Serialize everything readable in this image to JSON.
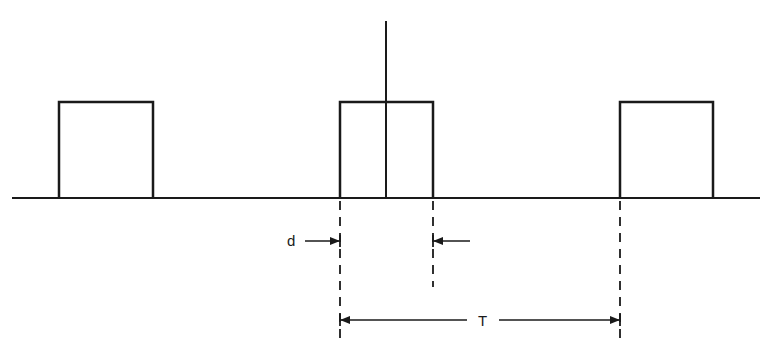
{
  "diagram": {
    "colors": {
      "stroke": "#1a1a1a",
      "background": "#ffffff"
    },
    "baseline": {
      "x1": 12,
      "x2": 760,
      "y": 198
    },
    "vertical_axis": {
      "x": 386,
      "y1": 21,
      "y2": 198
    },
    "pulses": [
      {
        "id": "left",
        "x1": 59,
        "x2": 153,
        "top": 102
      },
      {
        "id": "center",
        "x1": 340,
        "x2": 433,
        "top": 102
      },
      {
        "id": "right",
        "x1": 620,
        "x2": 713,
        "top": 102
      }
    ],
    "labels": {
      "pulse_width": "d",
      "period": "T"
    },
    "dimensions": {
      "pulse_width": {
        "from_x": 340,
        "to_x": 433,
        "y": 241
      },
      "period": {
        "from_x": 340,
        "to_x": 620,
        "y": 320
      }
    }
  }
}
